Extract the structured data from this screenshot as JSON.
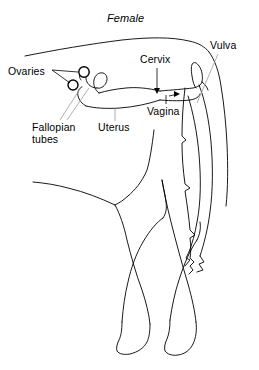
{
  "figure": {
    "title": "Female",
    "background_color": "#ffffff",
    "line_color": "#000000",
    "leader_line_color": "#808080"
  },
  "labels": {
    "ovaries": "Ovaries",
    "fallopian_tubes_line1": "Fallopian",
    "fallopian_tubes_line2": "tubes",
    "uterus": "Uterus",
    "cervix": "Cervix",
    "vagina": "Vagina",
    "vulva": "Vulva"
  }
}
